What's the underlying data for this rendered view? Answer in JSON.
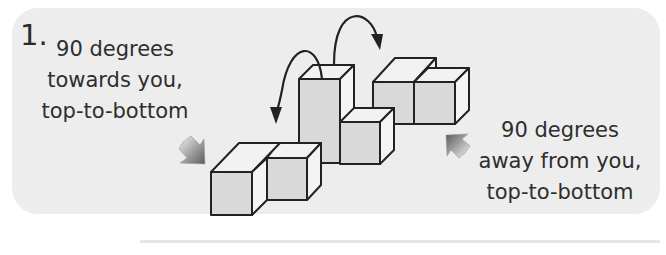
{
  "figure": {
    "step_number": "1.",
    "left_instruction": {
      "line1": "90 degrees",
      "line2": "towards you,",
      "line3": "top-to-bottom"
    },
    "right_instruction": {
      "line1": "90 degrees",
      "line2": "away from you,",
      "line3": "top-to-bottom"
    },
    "colors": {
      "panel_bg": "#ededed",
      "cube_front": "#d9d9d9",
      "cube_side": "#f4f4f4",
      "cube_top": "#f2f2f2",
      "outline": "#222222"
    }
  }
}
